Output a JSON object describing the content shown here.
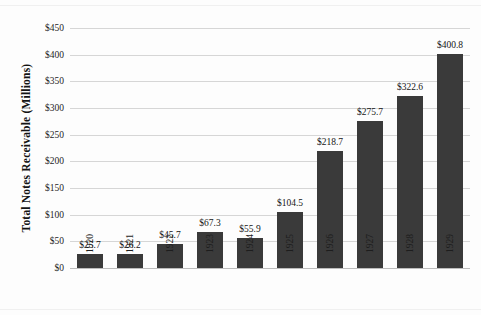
{
  "chart_data": {
    "type": "bar",
    "title": "",
    "xlabel": "",
    "ylabel": "Total Notes Receivable (Millions)",
    "categories": [
      "1920",
      "1921",
      "1922",
      "1923",
      "1924",
      "1925",
      "1926",
      "1927",
      "1928",
      "1929"
    ],
    "values": [
      25.7,
      26.2,
      45.7,
      67.3,
      55.9,
      104.5,
      218.7,
      275.7,
      322.6,
      400.8
    ],
    "data_labels": [
      "$25.7",
      "$26.2",
      "$45.7",
      "$67.3",
      "$55.9",
      "$104.5",
      "$218.7",
      "$275.7",
      "$322.6",
      "$400.8"
    ],
    "ylim": [
      0,
      450
    ],
    "y_tick_values": [
      0,
      50,
      100,
      150,
      200,
      250,
      300,
      350,
      400,
      450
    ],
    "y_tick_labels": [
      "$0",
      "$50",
      "$100",
      "$150",
      "$200",
      "$250",
      "$300",
      "$350",
      "$400",
      "$450"
    ],
    "grid": true,
    "legend": "none",
    "bar_color": "#3a3a3a",
    "gridline_color": "#d6d6d6",
    "background_color": "#fdfdfd",
    "x_tick_rotation_degrees": 90,
    "y_axis_title_rotation_degrees": 90
  }
}
